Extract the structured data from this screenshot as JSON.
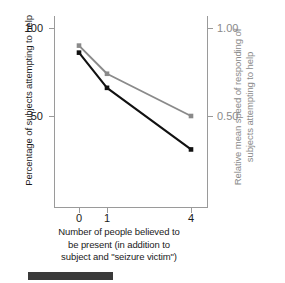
{
  "chart_data": {
    "type": "line",
    "title": "",
    "xlabel": "Number of people believed to be present (in addition to subject and \"seizure victim\")",
    "categories": [
      "0",
      "1",
      "4"
    ],
    "x": [
      0,
      1,
      4
    ],
    "grid": false,
    "legend": "none",
    "series": [
      {
        "name": "Percentage of subjects attempting to help",
        "axis": "left",
        "color": "#111111",
        "values": [
          86,
          66,
          31
        ],
        "marker": "square"
      },
      {
        "name": "Relative mean speed of responding of subjects attempting to help",
        "axis": "right",
        "color": "#8a8a8a",
        "values": [
          0.9,
          0.74,
          0.5
        ],
        "marker": "square"
      }
    ],
    "left_axis": {
      "label": "Percentage of subjects attempting to help",
      "ticks": [
        100,
        50
      ],
      "tick_labels": [
        "100",
        "50"
      ],
      "ylim": [
        0,
        109
      ]
    },
    "right_axis": {
      "label": "Relative mean speed of responding of subjects attempting to help",
      "ticks": [
        1.0,
        0.5
      ],
      "tick_labels": [
        "1.00",
        "0.50"
      ],
      "ylim": [
        0,
        1.09
      ]
    },
    "x_axis": {
      "label_line1": "Number of people believed to",
      "label_line2": "be present (in addition to",
      "label_line3": "subject and \"seizure victim\")",
      "tick_labels": [
        "0",
        "1",
        "4"
      ]
    }
  },
  "axis_titles": {
    "left": "Percentage of subjects attempting to help",
    "right": "Relative mean speed of responding of subjects attempting to help",
    "bottom": "Number of people believed to be present (in addition to subject and \"seizure victim\")"
  },
  "tick_labels": {
    "left_top": "100",
    "left_mid": "50",
    "right_top": "1.00",
    "right_mid": "0.50",
    "x0": "0",
    "x1": "1",
    "x4": "4"
  },
  "colors": {
    "black_series": "#111111",
    "gray_series": "#8a8a8a",
    "axis": "#9a9a9a",
    "caption_bar": "#3a3a3a"
  }
}
